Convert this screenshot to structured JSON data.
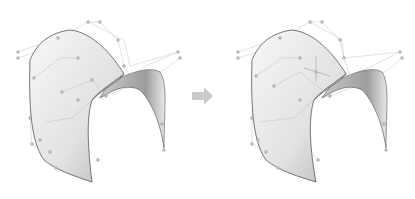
{
  "figure": {
    "left_panel": {
      "label": "before"
    },
    "right_panel": {
      "label": "after",
      "marker": "crosshair-on-control-point"
    },
    "arrow": {
      "direction": "right",
      "color": "#c8c8c8"
    },
    "colors": {
      "surface_light": "#f4f4f4",
      "surface_dark": "#9a9a9a",
      "edge": "#555555",
      "control_net": "#c4c4c4",
      "control_point": "#aaaaaa"
    }
  }
}
